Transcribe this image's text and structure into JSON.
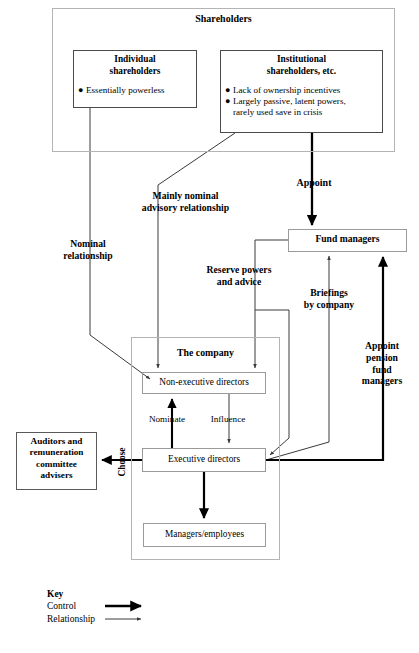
{
  "diagram": {
    "shareholders_group": {
      "title": "Shareholders"
    },
    "nodes": {
      "individual": {
        "title": "Individual\nshareholders",
        "bullets": [
          "Essentially powerless"
        ]
      },
      "institutional": {
        "title": "Institutional\nshareholders, etc.",
        "bullets": [
          "Lack of ownership incentives",
          "Largely passive, latent powers,"
        ],
        "bullet_continuation": "rarely used save in crisis"
      },
      "fund_managers": {
        "label": "Fund managers"
      },
      "company_group": {
        "title": "The company"
      },
      "non_executive_directors": {
        "label": "Non-executive directors"
      },
      "executive_directors": {
        "label": "Executive directors"
      },
      "managers_employees": {
        "label": "Managers/employees"
      },
      "auditors": {
        "label": "Auditors and\nremuneration\ncommittee\nadvisers"
      }
    },
    "edge_labels": {
      "appoint_top": "Appoint",
      "mainly_nominal": "Mainly nominal\nadvisory relationship",
      "nominal": "Nominal\nrelationship",
      "reserve_powers": "Reserve powers\nand advice",
      "briefings": "Briefings\nby company",
      "appoint_pension": "Appoint\npension\nfund\nmanagers",
      "nominate": "Nominate",
      "influence": "Influence",
      "choose": "Choose"
    },
    "key": {
      "title": "Key",
      "control": "Control",
      "relationship": "Relationship"
    },
    "caption": "",
    "colors": {
      "line_control": "#000000",
      "line_relationship": "#4d4d4d",
      "box_border_light": "#9a9a9a",
      "box_border_dark": "#4a4a4a",
      "group_border": "#b4b4b4",
      "text": "#000000",
      "background": "#ffffff"
    }
  }
}
